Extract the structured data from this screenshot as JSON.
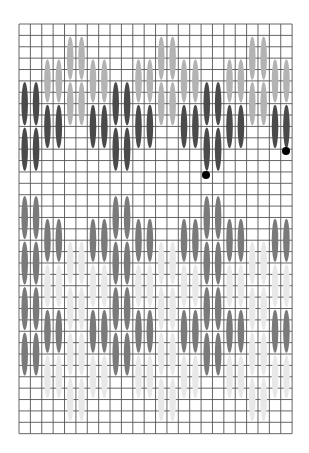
{
  "diagram": {
    "type": "needlework-stitch-chart",
    "grid": {
      "origin_x": 19,
      "origin_y": 24,
      "cell": 11.38,
      "cols": 24,
      "rows": 36,
      "line_color": "#555555",
      "line_width": 0.9
    },
    "colors": {
      "dark": "#4a4a4a",
      "light": "#b3b3b3",
      "mid": "#7a7a7a",
      "pale": "#e8e8e8",
      "dot": "#000000"
    },
    "stitch_length_rows": 4,
    "stitches": [
      {
        "cols": [
          0,
          1
        ],
        "rows": [
          5,
          9
        ],
        "color": "dark"
      },
      {
        "cols": [
          0,
          1
        ],
        "rows": [
          9,
          13
        ],
        "color": "dark"
      },
      {
        "cols": [
          2,
          3
        ],
        "rows": [
          3,
          7
        ],
        "color": "light"
      },
      {
        "cols": [
          2,
          3
        ],
        "rows": [
          7,
          11
        ],
        "color": "dark"
      },
      {
        "cols": [
          4,
          5
        ],
        "rows": [
          1,
          5
        ],
        "color": "light"
      },
      {
        "cols": [
          4,
          5
        ],
        "rows": [
          5,
          9
        ],
        "color": "light"
      },
      {
        "cols": [
          6,
          7
        ],
        "rows": [
          3,
          7
        ],
        "color": "light"
      },
      {
        "cols": [
          6,
          7
        ],
        "rows": [
          7,
          11
        ],
        "color": "dark"
      },
      {
        "cols": [
          8,
          9
        ],
        "rows": [
          5,
          9
        ],
        "color": "dark"
      },
      {
        "cols": [
          8,
          9
        ],
        "rows": [
          9,
          13
        ],
        "color": "dark"
      },
      {
        "cols": [
          10,
          11
        ],
        "rows": [
          3,
          7
        ],
        "color": "light"
      },
      {
        "cols": [
          10,
          11
        ],
        "rows": [
          7,
          11
        ],
        "color": "dark"
      },
      {
        "cols": [
          12,
          13
        ],
        "rows": [
          1,
          5
        ],
        "color": "light"
      },
      {
        "cols": [
          12,
          13
        ],
        "rows": [
          5,
          9
        ],
        "color": "light"
      },
      {
        "cols": [
          14,
          15
        ],
        "rows": [
          3,
          7
        ],
        "color": "light"
      },
      {
        "cols": [
          14,
          15
        ],
        "rows": [
          7,
          11
        ],
        "color": "dark"
      },
      {
        "cols": [
          16,
          17
        ],
        "rows": [
          5,
          9
        ],
        "color": "dark"
      },
      {
        "cols": [
          16,
          17
        ],
        "rows": [
          9,
          13
        ],
        "color": "dark"
      },
      {
        "cols": [
          18,
          19
        ],
        "rows": [
          3,
          7
        ],
        "color": "light"
      },
      {
        "cols": [
          18,
          19
        ],
        "rows": [
          7,
          11
        ],
        "color": "dark"
      },
      {
        "cols": [
          20,
          21
        ],
        "rows": [
          1,
          5
        ],
        "color": "light"
      },
      {
        "cols": [
          20,
          21
        ],
        "rows": [
          5,
          9
        ],
        "color": "light"
      },
      {
        "cols": [
          22,
          23
        ],
        "rows": [
          3,
          7
        ],
        "color": "light"
      },
      {
        "cols": [
          22,
          23
        ],
        "rows": [
          7,
          11
        ],
        "color": "dark"
      },
      {
        "cols": [
          0,
          1
        ],
        "rows": [
          15,
          19
        ],
        "color": "mid"
      },
      {
        "cols": [
          0,
          1
        ],
        "rows": [
          19,
          23
        ],
        "color": "mid"
      },
      {
        "cols": [
          0,
          1
        ],
        "rows": [
          23,
          27
        ],
        "color": "mid"
      },
      {
        "cols": [
          0,
          1
        ],
        "rows": [
          27,
          31
        ],
        "color": "mid"
      },
      {
        "cols": [
          2,
          3
        ],
        "rows": [
          17,
          21
        ],
        "color": "mid"
      },
      {
        "cols": [
          2,
          3
        ],
        "rows": [
          21,
          25
        ],
        "color": "pale"
      },
      {
        "cols": [
          2,
          3
        ],
        "rows": [
          25,
          29
        ],
        "color": "mid"
      },
      {
        "cols": [
          2,
          3
        ],
        "rows": [
          29,
          33
        ],
        "color": "pale"
      },
      {
        "cols": [
          4,
          5
        ],
        "rows": [
          19,
          23
        ],
        "color": "pale"
      },
      {
        "cols": [
          4,
          5
        ],
        "rows": [
          23,
          27
        ],
        "color": "pale"
      },
      {
        "cols": [
          4,
          5
        ],
        "rows": [
          27,
          31
        ],
        "color": "pale"
      },
      {
        "cols": [
          4,
          5
        ],
        "rows": [
          31,
          35
        ],
        "color": "pale"
      },
      {
        "cols": [
          6,
          7
        ],
        "rows": [
          17,
          21
        ],
        "color": "mid"
      },
      {
        "cols": [
          6,
          7
        ],
        "rows": [
          21,
          25
        ],
        "color": "pale"
      },
      {
        "cols": [
          6,
          7
        ],
        "rows": [
          25,
          29
        ],
        "color": "mid"
      },
      {
        "cols": [
          6,
          7
        ],
        "rows": [
          29,
          33
        ],
        "color": "pale"
      },
      {
        "cols": [
          8,
          9
        ],
        "rows": [
          15,
          19
        ],
        "color": "mid"
      },
      {
        "cols": [
          8,
          9
        ],
        "rows": [
          19,
          23
        ],
        "color": "mid"
      },
      {
        "cols": [
          8,
          9
        ],
        "rows": [
          23,
          27
        ],
        "color": "mid"
      },
      {
        "cols": [
          8,
          9
        ],
        "rows": [
          27,
          31
        ],
        "color": "mid"
      },
      {
        "cols": [
          10,
          11
        ],
        "rows": [
          17,
          21
        ],
        "color": "mid"
      },
      {
        "cols": [
          10,
          11
        ],
        "rows": [
          21,
          25
        ],
        "color": "pale"
      },
      {
        "cols": [
          10,
          11
        ],
        "rows": [
          25,
          29
        ],
        "color": "mid"
      },
      {
        "cols": [
          10,
          11
        ],
        "rows": [
          29,
          33
        ],
        "color": "pale"
      },
      {
        "cols": [
          12,
          13
        ],
        "rows": [
          19,
          23
        ],
        "color": "pale"
      },
      {
        "cols": [
          12,
          13
        ],
        "rows": [
          23,
          27
        ],
        "color": "pale"
      },
      {
        "cols": [
          12,
          13
        ],
        "rows": [
          27,
          31
        ],
        "color": "pale"
      },
      {
        "cols": [
          12,
          13
        ],
        "rows": [
          31,
          35
        ],
        "color": "pale"
      },
      {
        "cols": [
          14,
          15
        ],
        "rows": [
          17,
          21
        ],
        "color": "mid"
      },
      {
        "cols": [
          14,
          15
        ],
        "rows": [
          21,
          25
        ],
        "color": "pale"
      },
      {
        "cols": [
          14,
          15
        ],
        "rows": [
          25,
          29
        ],
        "color": "mid"
      },
      {
        "cols": [
          14,
          15
        ],
        "rows": [
          29,
          33
        ],
        "color": "pale"
      },
      {
        "cols": [
          16,
          17
        ],
        "rows": [
          15,
          19
        ],
        "color": "mid"
      },
      {
        "cols": [
          16,
          17
        ],
        "rows": [
          19,
          23
        ],
        "color": "mid"
      },
      {
        "cols": [
          16,
          17
        ],
        "rows": [
          23,
          27
        ],
        "color": "mid"
      },
      {
        "cols": [
          16,
          17
        ],
        "rows": [
          27,
          31
        ],
        "color": "mid"
      },
      {
        "cols": [
          18,
          19
        ],
        "rows": [
          17,
          21
        ],
        "color": "mid"
      },
      {
        "cols": [
          18,
          19
        ],
        "rows": [
          21,
          25
        ],
        "color": "pale"
      },
      {
        "cols": [
          18,
          19
        ],
        "rows": [
          25,
          29
        ],
        "color": "mid"
      },
      {
        "cols": [
          18,
          19
        ],
        "rows": [
          29,
          33
        ],
        "color": "pale"
      },
      {
        "cols": [
          20,
          21
        ],
        "rows": [
          19,
          23
        ],
        "color": "pale"
      },
      {
        "cols": [
          20,
          21
        ],
        "rows": [
          23,
          27
        ],
        "color": "pale"
      },
      {
        "cols": [
          20,
          21
        ],
        "rows": [
          27,
          31
        ],
        "color": "pale"
      },
      {
        "cols": [
          20,
          21
        ],
        "rows": [
          31,
          35
        ],
        "color": "pale"
      },
      {
        "cols": [
          22,
          23
        ],
        "rows": [
          17,
          21
        ],
        "color": "mid"
      },
      {
        "cols": [
          22,
          23
        ],
        "rows": [
          21,
          25
        ],
        "color": "pale"
      },
      {
        "cols": [
          22,
          23
        ],
        "rows": [
          25,
          29
        ],
        "color": "mid"
      },
      {
        "cols": [
          22,
          23
        ],
        "rows": [
          29,
          33
        ],
        "color": "pale"
      }
    ],
    "markers": [
      {
        "x": 206,
        "y": 175,
        "r": 4
      },
      {
        "x": 286,
        "y": 151,
        "r": 4
      }
    ]
  }
}
